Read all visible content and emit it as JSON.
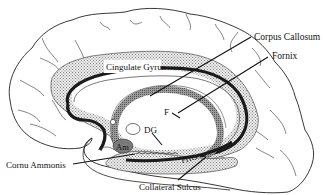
{
  "diagram": {
    "labels": {
      "corpus_callosum": "Corpus Callosum",
      "fornix": "Fornix",
      "cingulate_gyrus": "Cingulate Gyrus",
      "f": "F",
      "dg": "DG",
      "am": "Am",
      "phg": "PHG",
      "cornu_ammonis": "Cornu Ammonis",
      "collateral_sulcus": "Collateral Sulcus"
    },
    "colors": {
      "outline": "#222222",
      "stipple": "#cfcfcf",
      "dark_band": "#1a1a1a",
      "mid_gray": "#8a8a8a",
      "amygdala": "#7a7a7a"
    }
  }
}
